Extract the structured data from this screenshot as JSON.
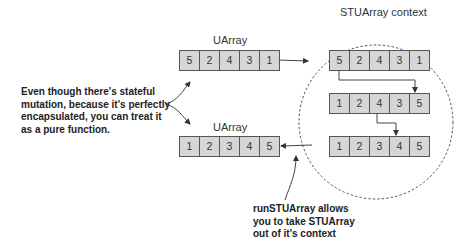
{
  "diagram": {
    "context_label": "STUArray context",
    "uarray_top": {
      "label": "UArray",
      "values": [
        "5",
        "2",
        "4",
        "3",
        "1"
      ]
    },
    "uarray_bottom": {
      "label": "UArray",
      "values": [
        "1",
        "2",
        "3",
        "4",
        "5"
      ]
    },
    "context_arrays": [
      {
        "values": [
          "5",
          "2",
          "4",
          "3",
          "1"
        ]
      },
      {
        "values": [
          "1",
          "2",
          "4",
          "3",
          "5"
        ]
      },
      {
        "values": [
          "1",
          "2",
          "3",
          "4",
          "5"
        ]
      }
    ],
    "left_note": [
      "Even though there's stateful",
      "mutation, because it's perfectly",
      "encapsulated, you can treat it",
      "as a pure function."
    ],
    "bottom_note": [
      "runSTUArray allows",
      "you to take STUArray",
      "out of it's context"
    ],
    "colors": {
      "cell_fill": "#d6d6d6",
      "cell_border": "#555555",
      "line": "#444444"
    }
  }
}
